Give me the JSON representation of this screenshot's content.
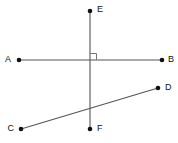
{
  "figure": {
    "background_color": "#ffffff",
    "line_color": "#555555",
    "point_color": "#111111",
    "angle_mark_color": "#777777",
    "canvas": {
      "width": 178,
      "height": 143
    }
  },
  "points": [
    {
      "id": "E",
      "label": "E",
      "x": 90,
      "y": 11,
      "label_x": 97,
      "label_y": 10
    },
    {
      "id": "A",
      "label": "A",
      "x": 19,
      "y": 60,
      "label_x": 8,
      "label_y": 60
    },
    {
      "id": "B",
      "label": "B",
      "x": 162,
      "y": 60,
      "label_x": 168,
      "label_y": 60
    },
    {
      "id": "D",
      "label": "D",
      "x": 158,
      "y": 88,
      "label_x": 165,
      "label_y": 88
    },
    {
      "id": "C",
      "label": "C",
      "x": 21,
      "y": 129,
      "label_x": 10,
      "label_y": 129
    },
    {
      "id": "F",
      "label": "F",
      "x": 90,
      "y": 129,
      "label_x": 97,
      "label_y": 129
    }
  ],
  "segments": [
    {
      "id": "EF",
      "name": "segment-ef",
      "x1": 90,
      "y1": 11,
      "x2": 90,
      "y2": 129
    },
    {
      "id": "AB",
      "name": "segment-ab",
      "x1": 19,
      "y1": 60,
      "x2": 162,
      "y2": 60
    },
    {
      "id": "CD",
      "name": "segment-cd",
      "x1": 21,
      "y1": 129,
      "x2": 158,
      "y2": 88
    }
  ],
  "intersections": [
    {
      "id": "EF-AB",
      "x": 90,
      "y": 60,
      "right_angle": true
    },
    {
      "id": "EF-CD",
      "x": 90,
      "y": 109,
      "right_angle": false
    }
  ],
  "right_angle_marker": {
    "name": "right-angle-marker",
    "path": "M 90 53.5 L 96.5 53.5 L 96.5 60"
  }
}
